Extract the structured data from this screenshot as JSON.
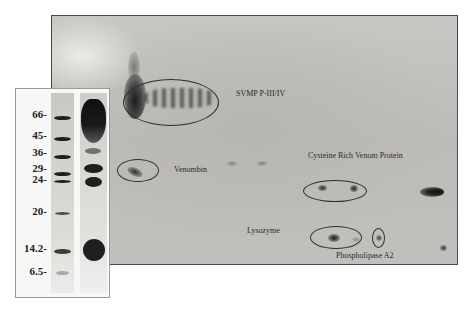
{
  "figure": {
    "type": "2D gel electrophoresis of snake venom with 1D SDS-PAGE inset",
    "colors": {
      "gel_background": "#c4c2be",
      "inset_background": "#f7f7f5",
      "band": "#1f1f1f",
      "annotation_line": "#2f2f2f"
    }
  },
  "inset": {
    "molecular_weight_markers": [
      {
        "label": "66-",
        "value": 66
      },
      {
        "label": "45-",
        "value": 45
      },
      {
        "label": "36-",
        "value": 36
      },
      {
        "label": "29-",
        "value": 29
      },
      {
        "label": "24-",
        "value": 24
      },
      {
        "label": "20-",
        "value": 20
      },
      {
        "label": "14.2-",
        "value": 14.2
      },
      {
        "label": "6.5-",
        "value": 6.5
      }
    ],
    "lanes": [
      "marker",
      "sample"
    ]
  },
  "annotations": [
    {
      "id": "svmp",
      "label": "SVMP P-III/IV"
    },
    {
      "id": "venombin",
      "label": "Venombin"
    },
    {
      "id": "crvp",
      "label": "Cysteine Rich Venom Protein"
    },
    {
      "id": "lysozyme",
      "label": "Lysozyme"
    },
    {
      "id": "pla2",
      "label": "Phospholipase A2"
    }
  ]
}
